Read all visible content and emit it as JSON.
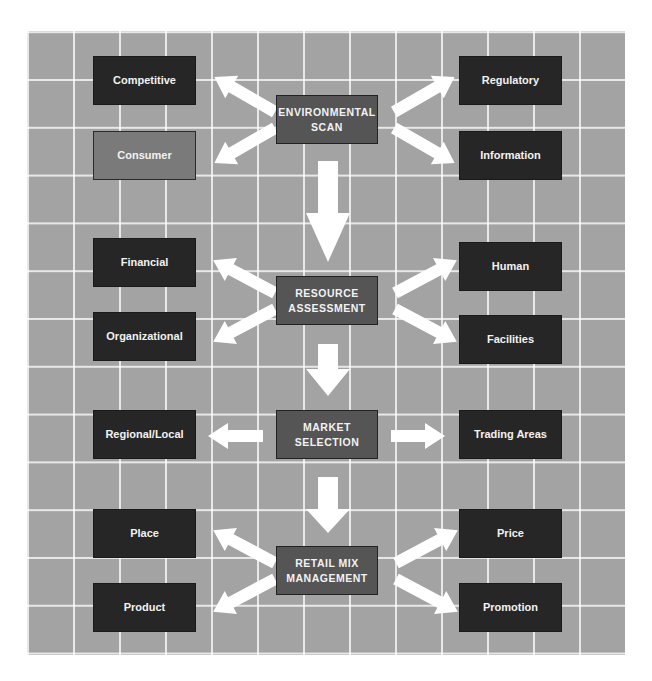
{
  "diagram": {
    "type": "flowchart",
    "stages": [
      {
        "id": "environmental-scan",
        "title": "ENVIRONMENTAL\nSCAN",
        "left": [
          {
            "label": "Competitive"
          },
          {
            "label": "Consumer"
          }
        ],
        "right": [
          {
            "label": "Regulatory"
          },
          {
            "label": "Information"
          }
        ]
      },
      {
        "id": "resource-assessment",
        "title": "RESOURCE\nASSESSMENT",
        "left": [
          {
            "label": "Financial"
          },
          {
            "label": "Organizational"
          }
        ],
        "right": [
          {
            "label": "Human"
          },
          {
            "label": "Facilities"
          }
        ]
      },
      {
        "id": "market-selection",
        "title": "MARKET\nSELECTION",
        "left": [
          {
            "label": "Regional/Local"
          }
        ],
        "right": [
          {
            "label": "Trading Areas"
          }
        ]
      },
      {
        "id": "retail-mix-management",
        "title": "RETAIL MIX\nMANAGEMENT",
        "left": [
          {
            "label": "Place"
          },
          {
            "label": "Product"
          }
        ],
        "right": [
          {
            "label": "Price"
          },
          {
            "label": "Promotion"
          }
        ]
      }
    ],
    "colors": {
      "background_grid": "#a3a3a3",
      "grid_lines": "#ffffff",
      "side_box": "#262626",
      "highlight_box": "#7a7a7a",
      "center_box": "#555555",
      "arrows": "#ffffff",
      "text": "#f2f2f2"
    }
  }
}
